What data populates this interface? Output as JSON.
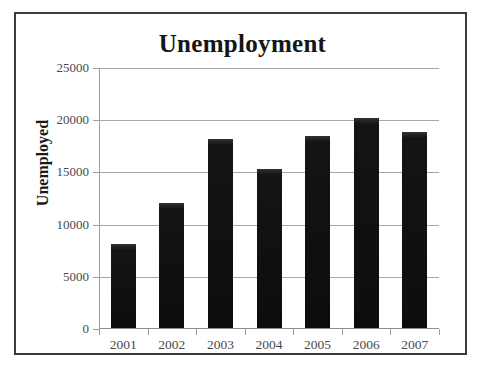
{
  "chart_data": {
    "type": "bar",
    "title": "Unemployment",
    "xlabel": "",
    "ylabel": "Unemployed",
    "categories": [
      "2001",
      "2002",
      "2003",
      "2004",
      "2005",
      "2006",
      "2007"
    ],
    "values": [
      8000,
      12000,
      18100,
      15250,
      18400,
      20150,
      18800
    ],
    "ylim": [
      0,
      25000
    ],
    "yticks": [
      0,
      5000,
      10000,
      15000,
      20000,
      25000
    ],
    "ytick_labels": [
      "0",
      "5000",
      "10000",
      "15000",
      "20000",
      "25000"
    ],
    "grid": true,
    "legend": "none",
    "bar_color": "#111111",
    "gridline_color": "#a9a9a9",
    "axis_color": "#9d9d9d",
    "text_color": "#4a4a4a",
    "title_color": "#161616",
    "frame_color": "#3b3b3b",
    "background": "#ffffff"
  }
}
